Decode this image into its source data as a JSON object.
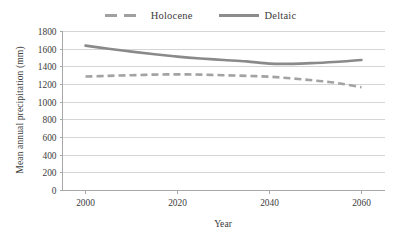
{
  "chart_data": {
    "type": "line",
    "title": "",
    "xlabel": "Year",
    "ylabel": "Mean annual precipitation (mm)",
    "xlim": [
      1995,
      2065
    ],
    "ylim": [
      0,
      1800
    ],
    "grid": true,
    "legend_position": "top-center",
    "x_ticks": [
      "2000",
      "2020",
      "2040",
      "2060"
    ],
    "x_tick_values": [
      2000,
      2020,
      2040,
      2060
    ],
    "y_ticks": [
      "0",
      "200",
      "400",
      "600",
      "800",
      "1000",
      "1200",
      "1400",
      "1600",
      "1800"
    ],
    "y_tick_values": [
      0,
      200,
      400,
      600,
      800,
      1000,
      1200,
      1400,
      1600,
      1800
    ],
    "x": [
      2000,
      2005,
      2010,
      2015,
      2020,
      2025,
      2030,
      2035,
      2040,
      2045,
      2050,
      2055,
      2060
    ],
    "series": [
      {
        "name": "Holocene",
        "style": "dashed",
        "color": "#a3a3a3",
        "values": [
          1290,
          1298,
          1305,
          1312,
          1315,
          1312,
          1305,
          1298,
          1288,
          1268,
          1244,
          1215,
          1168
        ]
      },
      {
        "name": "Deltaic",
        "style": "solid",
        "color": "#8a8a8a",
        "values": [
          1640,
          1605,
          1572,
          1542,
          1516,
          1495,
          1478,
          1462,
          1436,
          1434,
          1444,
          1458,
          1478
        ]
      }
    ]
  },
  "legend": {
    "entries": [
      {
        "label": "Holocene",
        "style": "dashed"
      },
      {
        "label": "Deltaic",
        "style": "solid"
      }
    ]
  },
  "axes": {
    "y_title": "Mean annual precipitation (mm)",
    "x_title": "Year"
  },
  "colors": {
    "gridline": "#d5d5d5",
    "axis": "#a8a8a8",
    "text": "#3b3b3b",
    "series_deltaic": "#8a8a8a",
    "series_holocene": "#a3a3a3",
    "background": "#ffffff"
  }
}
